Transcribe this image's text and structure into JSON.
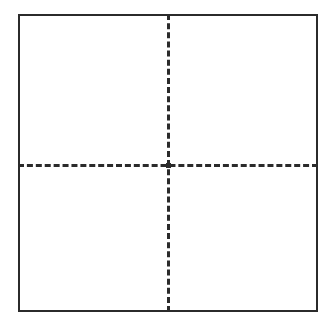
{
  "figure": {
    "background_color": "#ffffff"
  },
  "frame": {
    "name": "outer-square-border",
    "stroke_color": "#2b2b2b",
    "stroke_width_px": 2,
    "stroke_style": "solid",
    "fill_color": "#ffffff",
    "x_px": 18,
    "y_px": 14,
    "width_px": 300,
    "height_px": 298
  },
  "dividers": {
    "stroke_color": "#2b2b2b",
    "stroke_width_px": 3,
    "stroke_style": "dashed",
    "dash_length_px": 7,
    "gap_length_px": 4,
    "vertical": {
      "name": "vertical-dashed-divider",
      "position_percent": 50,
      "orientation": "vertical"
    },
    "horizontal": {
      "name": "horizontal-dashed-divider",
      "position_percent": 51,
      "orientation": "horizontal"
    },
    "intersection": {
      "name": "crosshair-intersection",
      "x_px": 168,
      "y_px": 170
    }
  },
  "quadrants": [
    {
      "id": "top-left",
      "label": ""
    },
    {
      "id": "top-right",
      "label": ""
    },
    {
      "id": "bottom-left",
      "label": ""
    },
    {
      "id": "bottom-right",
      "label": ""
    }
  ]
}
